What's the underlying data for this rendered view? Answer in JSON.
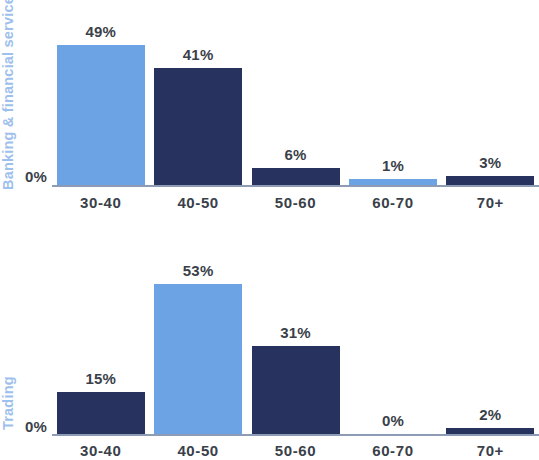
{
  "chart_data": [
    {
      "type": "bar",
      "title": "Banking & financial services",
      "series_label": "Banking & financial services",
      "xlabel": "",
      "ylabel": "",
      "ylim": [
        0,
        53
      ],
      "grid": false,
      "legend": "none",
      "axis_zero_label": "0%",
      "categories": [
        "30-40",
        "40-50",
        "50-60",
        "60-70",
        "70+"
      ],
      "values": [
        49,
        41,
        6,
        1,
        3
      ],
      "value_labels": [
        "49%",
        "41%",
        "6%",
        "1%",
        "3%"
      ],
      "bar_colors": [
        "light",
        "dark",
        "dark",
        "light",
        "dark"
      ]
    },
    {
      "type": "bar",
      "title": "Trading",
      "series_label": "Trading",
      "xlabel": "",
      "ylabel": "",
      "ylim": [
        0,
        53
      ],
      "grid": false,
      "legend": "none",
      "axis_zero_label": "0%",
      "categories": [
        "30-40",
        "40-50",
        "50-60",
        "60-70",
        "70+"
      ],
      "values": [
        15,
        53,
        31,
        0,
        2
      ],
      "value_labels": [
        "15%",
        "53%",
        "31%",
        "0%",
        "2%"
      ],
      "bar_colors": [
        "dark",
        "light",
        "dark",
        "dark",
        "dark"
      ]
    }
  ],
  "colors": {
    "light_blue": "#6BA3E4",
    "dark_navy": "#27325F",
    "series_label": "#9EC0EC",
    "axis_line": "#8E9BB5",
    "text": "#3A3F4A",
    "background": "#FFFFFF"
  }
}
